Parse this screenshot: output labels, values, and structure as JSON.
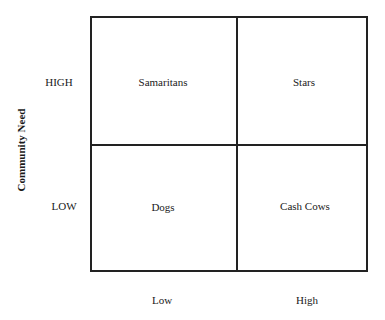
{
  "diagram": {
    "type": "2x2 matrix",
    "y_axis_title": "Community Need",
    "row_labels": [
      "HIGH",
      "LOW"
    ],
    "col_labels": [
      "Low",
      "High"
    ],
    "quadrants": {
      "top_left": "Samaritans",
      "top_right": "Stars",
      "bottom_left": "Dogs",
      "bottom_right": "Cash Cows"
    },
    "line_color": "#222222",
    "background": "#ffffff"
  }
}
